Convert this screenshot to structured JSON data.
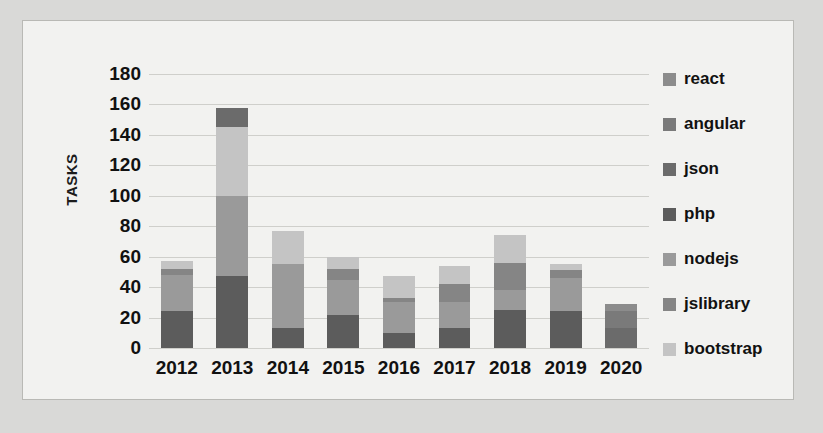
{
  "chart_data": {
    "type": "bar",
    "stacked": true,
    "title": "",
    "xlabel": "",
    "ylabel": "TASKS",
    "ylim": [
      0,
      180
    ],
    "ytick_step": 20,
    "yticks": [
      "180",
      "160",
      "140",
      "120",
      "100",
      "80",
      "60",
      "40",
      "20",
      "0"
    ],
    "grid": true,
    "legend_position": "right",
    "categories": [
      "2012",
      "2013",
      "2014",
      "2015",
      "2016",
      "2017",
      "2018",
      "2019",
      "2020"
    ],
    "series": [
      {
        "name": "react",
        "color": "#8c8c8c",
        "values": [
          0,
          0,
          0,
          0,
          0,
          0,
          0,
          0,
          5
        ]
      },
      {
        "name": "angular",
        "color": "#7a7a7a",
        "values": [
          0,
          0,
          0,
          0,
          0,
          0,
          0,
          0,
          11
        ]
      },
      {
        "name": "json",
        "color": "#6b6b6b",
        "values": [
          0,
          13,
          0,
          0,
          0,
          0,
          0,
          0,
          13
        ]
      },
      {
        "name": "php",
        "color": "#5c5c5c",
        "values": [
          24,
          47,
          13,
          22,
          10,
          13,
          25,
          24,
          0
        ]
      },
      {
        "name": "nodejs",
        "color": "#9a9a9a",
        "values": [
          24,
          53,
          42,
          23,
          20,
          17,
          13,
          22,
          0
        ]
      },
      {
        "name": "jslibrary",
        "color": "#858585",
        "values": [
          4,
          0,
          0,
          7,
          3,
          12,
          18,
          5,
          0
        ]
      },
      {
        "name": "bootstrap",
        "color": "#c4c4c4",
        "values": [
          5,
          45,
          22,
          8,
          14,
          12,
          18,
          4,
          0
        ]
      }
    ],
    "totals": [
      57,
      173,
      85,
      70,
      61,
      54,
      85,
      76,
      29
    ],
    "stack_order_bottom_to_top": [
      "php",
      "nodejs",
      "jslibrary",
      "bootstrap",
      "json",
      "angular",
      "react"
    ]
  },
  "legend": {
    "items": [
      {
        "label": "react",
        "color": "#8c8c8c"
      },
      {
        "label": "angular",
        "color": "#7a7a7a"
      },
      {
        "label": "json",
        "color": "#6b6b6b"
      },
      {
        "label": "php",
        "color": "#5c5c5c"
      },
      {
        "label": "nodejs",
        "color": "#9a9a9a"
      },
      {
        "label": "jslibrary",
        "color": "#858585"
      },
      {
        "label": "bootstrap",
        "color": "#c4c4c4"
      }
    ]
  }
}
